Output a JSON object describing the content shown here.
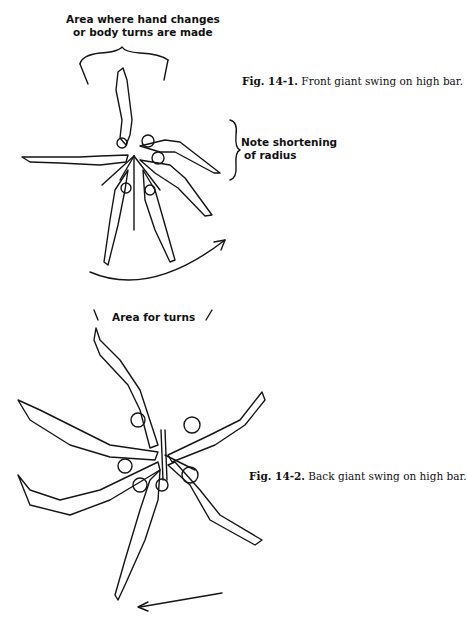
{
  "figure_1": {
    "label_top_line1": "Area where hand changes",
    "label_top_line2": "or body turns are made",
    "label_side_line1": "Note shortening",
    "label_side_line2": "of radius",
    "caption_number": "Fig. 14-1.",
    "caption_text": " Front giant swing on high bar."
  },
  "figure_2": {
    "label_top": "Area for turns",
    "caption_number": "Fig. 14-2.",
    "caption_text": " Back giant swing on high bar."
  }
}
